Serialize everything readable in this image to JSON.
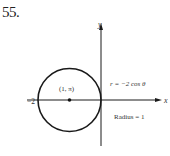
{
  "problem": {
    "number": "55."
  },
  "diagram": {
    "axes": {
      "x_label": "x",
      "y_label": "y"
    },
    "tick_labels": {
      "x_neg": "−2"
    },
    "center_point": {
      "label": "(1, π)"
    },
    "equation": "r = −2 cos θ",
    "radius_note": "Radius = 1",
    "colors": {
      "stroke": "#1a1a1a",
      "text": "#333333",
      "background": "#ffffff"
    }
  }
}
